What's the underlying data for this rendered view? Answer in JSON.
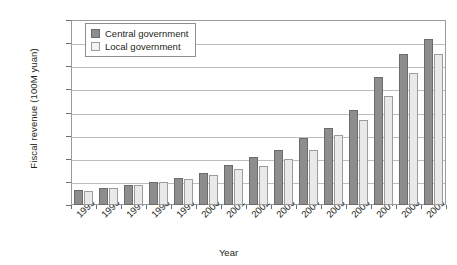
{
  "chart_data": {
    "type": "bar",
    "title": "",
    "xlabel": "Year",
    "ylabel": "Fiscal revenue (100M yuan)",
    "ylim": [
      0,
      40000
    ],
    "ytick_labels": [
      "0",
      "5000",
      "10,000",
      "15,000",
      "20,000",
      "25,000",
      "30,000",
      "35,000",
      "40,000"
    ],
    "ytick_values": [
      0,
      5000,
      10000,
      15000,
      20000,
      25000,
      30000,
      35000,
      40000
    ],
    "grid": true,
    "legend_position": "top-left",
    "categories": [
      "1995",
      "1996",
      "1997",
      "1998",
      "1999",
      "2000",
      "2001",
      "2002",
      "2003",
      "2004",
      "2005",
      "2006",
      "2007",
      "2008",
      "2009"
    ],
    "series": [
      {
        "name": "Central government",
        "color": "#8d8d8d",
        "values": [
          3256,
          3661,
          4227,
          4892,
          5849,
          6989,
          8583,
          10389,
          11865,
          14503,
          16549,
          20457,
          27749,
          32681,
          35916
        ]
      },
      {
        "name": "Local government",
        "color": "#e9e9e9",
        "values": [
          2986,
          3747,
          4424,
          4984,
          5595,
          6406,
          7803,
          8515,
          9850,
          11893,
          15101,
          18304,
          23573,
          28650,
          32581
        ]
      }
    ]
  }
}
